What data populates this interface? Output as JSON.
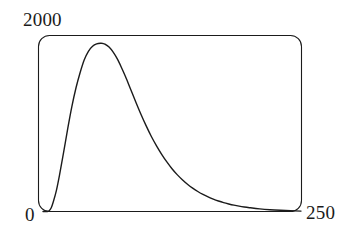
{
  "figure": {
    "width": 351,
    "height": 241,
    "background_color": "#ffffff",
    "frame": {
      "x": 38,
      "y": 35,
      "width": 264,
      "height": 177,
      "corner_radius": 11,
      "stroke_color": "#1b1b1b",
      "stroke_width": 1
    }
  },
  "labels": {
    "y_max": "2000",
    "x_min": "0",
    "x_max": "250"
  },
  "chart_data": {
    "type": "line",
    "title": "",
    "subtitle": "",
    "xlabel": "",
    "ylabel": "",
    "xlim": [
      0,
      250
    ],
    "ylim": [
      0,
      2000
    ],
    "grid": false,
    "legend": null,
    "tick_labels": {
      "x": [
        "0",
        "250"
      ],
      "y": [
        "0",
        "2000"
      ]
    },
    "annotations": [],
    "line_color": "#1b1b1b",
    "line_width": 1.4,
    "series": [
      {
        "name": "distribution",
        "description": "right-skewed unimodal distribution, peak near x=58 at y=1980",
        "x": [
          0,
          4,
          6,
          8,
          10,
          13,
          16,
          20,
          24,
          28,
          32,
          36,
          40,
          44,
          48,
          52,
          56,
          58,
          60,
          64,
          68,
          72,
          76,
          80,
          85,
          90,
          95,
          100,
          105,
          110,
          115,
          120,
          125,
          130,
          135,
          140,
          145,
          150,
          155,
          160,
          165,
          170,
          175,
          180,
          185,
          190,
          195,
          200,
          210,
          220,
          230,
          240,
          250
        ],
        "y": [
          0,
          0,
          10,
          45,
          115,
          250,
          430,
          700,
          980,
          1240,
          1460,
          1640,
          1790,
          1890,
          1950,
          1978,
          1985,
          1982,
          1975,
          1940,
          1880,
          1800,
          1700,
          1590,
          1440,
          1290,
          1145,
          1010,
          885,
          775,
          675,
          585,
          505,
          435,
          375,
          322,
          276,
          236,
          202,
          172,
          146,
          124,
          105,
          89,
          75,
          63,
          53,
          45,
          31,
          21,
          14,
          9,
          5
        ]
      }
    ]
  }
}
